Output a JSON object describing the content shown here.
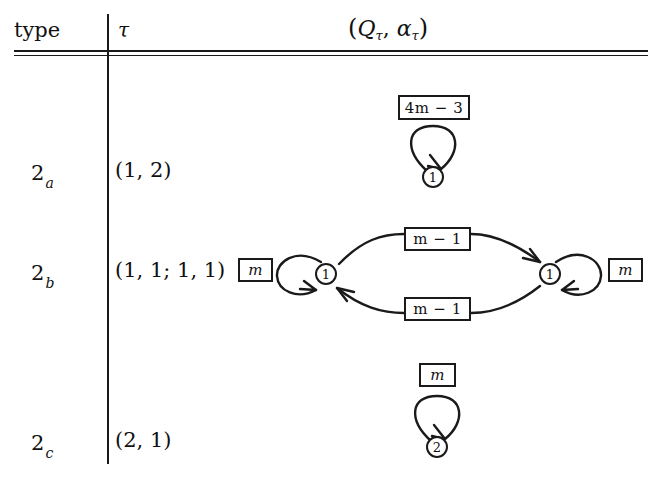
{
  "table": {
    "headers": {
      "type": "type",
      "tau": "τ",
      "automaton": "(Qτ, ατ)"
    },
    "rows": [
      {
        "type_main": "2",
        "type_sub": "a",
        "tau": "(1, 2)",
        "automaton": {
          "kind": "single-state-self-loop",
          "states": [
            {
              "label": "1"
            }
          ],
          "loop_labels": [
            "4m − 3"
          ]
        }
      },
      {
        "type_main": "2",
        "type_sub": "b",
        "tau": "(1, 1; 1, 1)",
        "automaton": {
          "kind": "two-state-bidirectional",
          "states": [
            {
              "label": "1"
            },
            {
              "label": "1"
            }
          ],
          "left_loop_label": "m",
          "right_loop_label": "m",
          "top_edge_label": "m − 1",
          "bottom_edge_label": "m − 1"
        }
      },
      {
        "type_main": "2",
        "type_sub": "c",
        "tau": "(2, 1)",
        "automaton": {
          "kind": "single-state-self-loop",
          "states": [
            {
              "label": "2"
            }
          ],
          "loop_labels": [
            "m"
          ]
        }
      }
    ]
  },
  "colors": {
    "ink": "#1a1a1a",
    "paper": "#ffffff"
  }
}
